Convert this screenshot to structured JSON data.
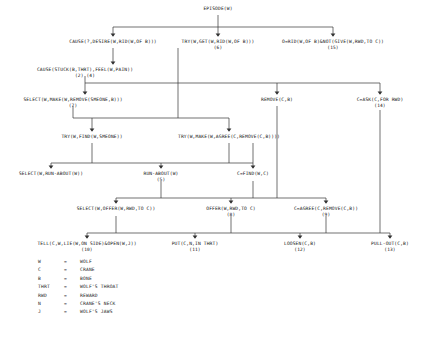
{
  "diagram": {
    "title_node": "EPISODE(W)",
    "nodes": [
      {
        "id": "episode",
        "label": "EPISODE(W)",
        "num": "",
        "x": 218,
        "y": 10
      },
      {
        "id": "cause-desire",
        "label": "CAUSE(?,DESIRE(W,RID(W,OF B)))",
        "num": "",
        "x": 113,
        "y": 43
      },
      {
        "id": "try-get-rid",
        "label": "TRY(W,GET(W,RID(W,OF B)))",
        "num": "(6)",
        "x": 218,
        "y": 43
      },
      {
        "id": "o-rid",
        "label": "O=RID(W,OF B)&NOT(GIVE(W,RWD,TO C))",
        "num": "(15)",
        "x": 333,
        "y": 43
      },
      {
        "id": "cause-stuck",
        "label": "CAUSE(STUCK(B,THRT),FEEL(W,PAIN))",
        "num": "(2)          (4)",
        "x": 85,
        "y": 71
      },
      {
        "id": "select-make",
        "label": "SELECT(W,MAKE(W,REMOVE(SMEONE,B)))",
        "num": "(7)",
        "x": 73,
        "y": 101
      },
      {
        "id": "remove-cb",
        "label": "REMOVE(C,B)",
        "num": "",
        "x": 277,
        "y": 101
      },
      {
        "id": "c-ask",
        "label": "C=ASK(C,FOR RWD)",
        "num": "(14)",
        "x": 380,
        "y": 101
      },
      {
        "id": "try-find",
        "label": "TRY(W,FIND(W,SMEONE))",
        "num": "",
        "x": 92,
        "y": 138
      },
      {
        "id": "try-make-agree",
        "label": "TRY(W,MAKE(W,AGREE(C,REMOVE(C,B))))",
        "num": "",
        "x": 229,
        "y": 138
      },
      {
        "id": "select-run",
        "label": "SELECT(W,RUN-ABOUT(W))",
        "num": "",
        "x": 51,
        "y": 175
      },
      {
        "id": "run-about",
        "label": "RUN-ABOUT(W)",
        "num": "(5)",
        "x": 161,
        "y": 175
      },
      {
        "id": "c-find",
        "label": "C=FIND(W,C)",
        "num": "",
        "x": 253,
        "y": 175
      },
      {
        "id": "select-offer",
        "label": "SELECT(W,OFFER(W,RWD,TO C))",
        "num": "",
        "x": 116,
        "y": 210
      },
      {
        "id": "offer",
        "label": "OFFER(W,RWD,TO C)",
        "num": "(8)",
        "x": 231,
        "y": 210
      },
      {
        "id": "c-agree",
        "label": "C=AGREE(C,REMOVE(C,B))",
        "num": "(9)",
        "x": 326,
        "y": 210
      },
      {
        "id": "tell",
        "label": "TELL(C,W,LIE(W,ON SIDE)&OPEN(W,J))",
        "num": "(10)",
        "x": 87,
        "y": 245
      },
      {
        "id": "put",
        "label": "PUT(C,N,IN THRT)",
        "num": "(11)",
        "x": 195,
        "y": 245
      },
      {
        "id": "loosen",
        "label": "LOOSEN(C,B)",
        "num": "(12)",
        "x": 300,
        "y": 245
      },
      {
        "id": "pull-out",
        "label": "PULL-OUT(C,B)",
        "num": "(13)",
        "x": 390,
        "y": 245
      }
    ],
    "legend": [
      {
        "symbol": "W",
        "equals": "=",
        "meaning": "WOLF"
      },
      {
        "symbol": "C",
        "equals": "=",
        "meaning": "CRANE"
      },
      {
        "symbol": "B",
        "equals": "=",
        "meaning": "BONE"
      },
      {
        "symbol": "THRT",
        "equals": "=",
        "meaning": "WOLF'S THROAT"
      },
      {
        "symbol": "RWD",
        "equals": "=",
        "meaning": "REWARD"
      },
      {
        "symbol": "N",
        "equals": "=",
        "meaning": "CRANE'S NECK"
      },
      {
        "symbol": "J",
        "equals": "=",
        "meaning": "WOLF'S JAWS"
      }
    ],
    "caption": ""
  },
  "style": {
    "line_color": "#333333",
    "text_color": "#111111",
    "background": "#ffffff"
  }
}
